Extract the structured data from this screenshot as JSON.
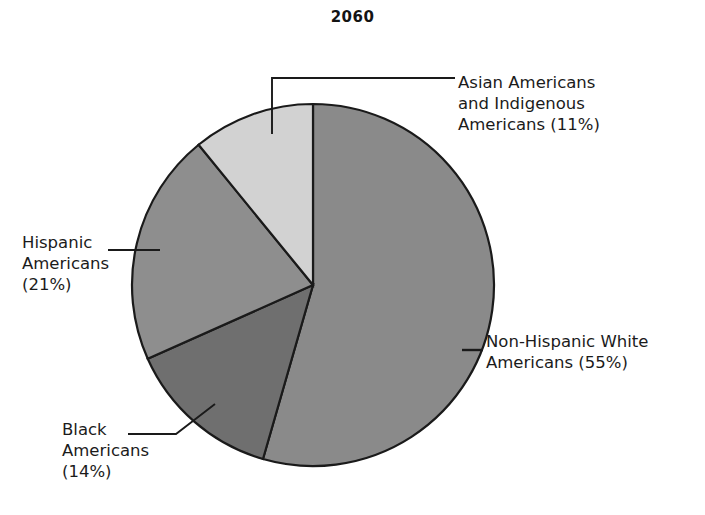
{
  "chart_data": {
    "type": "pie",
    "title": "2060",
    "xlabel": "",
    "ylabel": "",
    "legend_position": "callout-labels",
    "grid": false,
    "start_angle_deg": 0,
    "direction": "clockwise",
    "categories": [
      "Non-Hispanic White Americans",
      "Black Americans",
      "Hispanic Americans",
      "Asian Americans and Indigenous Americans"
    ],
    "values": [
      55,
      14,
      21,
      11
    ],
    "unit": "%",
    "labels": [
      "Non-Hispanic White Americans (55%)",
      "Black Americans (14%)",
      "Hispanic Americans (21%)",
      "Asian Americans and Indigenous Americans (11%)"
    ],
    "colors": [
      "#8a8a8a",
      "#6f6f6f",
      "#8e8e8e",
      "#d2d2d2"
    ],
    "slices": [
      {
        "name": "Non-Hispanic White Americans",
        "value": 55,
        "color": "#8a8a8a",
        "label": "Non-Hispanic White\nAmericans (55%)"
      },
      {
        "name": "Black Americans",
        "value": 14,
        "color": "#6f6f6f",
        "label": "Black\nAmericans\n(14%)"
      },
      {
        "name": "Hispanic Americans",
        "value": 21,
        "color": "#8e8e8e",
        "label": "Hispanic\nAmericans\n(21%)"
      },
      {
        "name": "Asian Americans and Indigenous Americans",
        "value": 11,
        "color": "#d2d2d2",
        "label": "Asian Americans\nand Indigenous\nAmericans (11%)"
      }
    ]
  },
  "chart": {
    "title": "2060",
    "label_asian": "Asian Americans\nand Indigenous\nAmericans (11%)",
    "label_white": "Non-Hispanic White\nAmericans (55%)",
    "label_black": "Black\nAmericans\n(14%)",
    "label_hispanic": "Hispanic\nAmericans\n(21%)",
    "stroke_color": "#1a1a1a",
    "background": "#ffffff"
  }
}
